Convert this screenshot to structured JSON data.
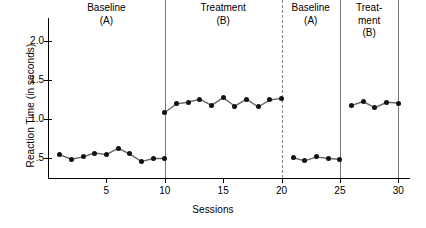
{
  "chart_data": {
    "type": "line",
    "title": "",
    "xlabel": "Sessions",
    "ylabel": "Reaction Time (in seconds)",
    "xlim": [
      0,
      31
    ],
    "ylim": [
      0.25,
      2.3
    ],
    "xticks": [
      5,
      10,
      15,
      20,
      25,
      30
    ],
    "xtick_labels": [
      "5",
      "10",
      "15",
      "20",
      "25",
      "30"
    ],
    "yticks": [
      0.5,
      1.0,
      1.5,
      2.0
    ],
    "ytick_labels": [
      ".5",
      "1.0",
      "1.5",
      "2.0"
    ],
    "grid": false,
    "legend": "none",
    "marker": "filled-circle",
    "line_color": "#666666",
    "marker_color": "#111111",
    "design": "ABAB reversal design",
    "phases": [
      {
        "name": "Baseline",
        "condition": "(A)",
        "label_lines": [
          "Baseline",
          "(A)"
        ],
        "x_start": 1,
        "x_end": 10,
        "separator_after": "solid",
        "separator_x": 10,
        "x": [
          1,
          2,
          3,
          4,
          5,
          6,
          7,
          8,
          9,
          10
        ],
        "values": [
          0.55,
          0.49,
          0.52,
          0.57,
          0.55,
          0.63,
          0.56,
          0.46,
          0.5,
          0.5
        ]
      },
      {
        "name": "Treatment",
        "condition": "(B)",
        "label_lines": [
          "Treatment",
          "(B)"
        ],
        "x_start": 10,
        "x_end": 20,
        "separator_after": "dashed",
        "separator_x": 20,
        "x": [
          10,
          11,
          12,
          13,
          14,
          15,
          16,
          17,
          18,
          19,
          20
        ],
        "values": [
          1.09,
          1.2,
          1.22,
          1.26,
          1.18,
          1.28,
          1.17,
          1.26,
          1.16,
          1.25,
          1.27
        ]
      },
      {
        "name": "Baseline",
        "condition": "(A)",
        "label_lines": [
          "Baseline",
          "(A)"
        ],
        "x_start": 21,
        "x_end": 25,
        "separator_after": "solid",
        "separator_x": 25,
        "x": [
          21,
          22,
          23,
          24,
          25
        ],
        "values": [
          0.51,
          0.47,
          0.52,
          0.5,
          0.49
        ]
      },
      {
        "name": "Treatment",
        "condition": "(B)",
        "label_lines": [
          "Treat-",
          "ment",
          "(B)"
        ],
        "x_start": 26,
        "x_end": 30,
        "separator_after": "solid",
        "separator_x": 30,
        "x": [
          26,
          27,
          28,
          29,
          30
        ],
        "values": [
          1.18,
          1.23,
          1.15,
          1.22,
          1.21
        ]
      }
    ]
  }
}
